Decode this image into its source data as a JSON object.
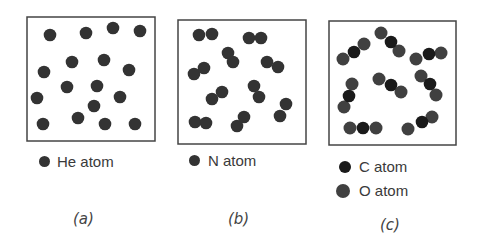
{
  "colors": {
    "he_atom": "#333333",
    "n_atom": "#333333",
    "c_atom": "#1a1a1a",
    "o_atom": "#404040",
    "box_border": "#444444",
    "text": "#3a3a3a"
  },
  "panels": [
    {
      "id": "a",
      "caption": "(a)",
      "legend": [
        {
          "label": "He atom",
          "atom": "he_atom"
        }
      ],
      "box": {
        "x": 27,
        "y": 17,
        "w": 128,
        "h": 124
      },
      "description": "Monatomic gas: helium atoms",
      "atoms": [
        [
          50,
          35
        ],
        [
          86,
          33
        ],
        [
          113,
          28
        ],
        [
          140,
          31
        ],
        [
          72,
          62
        ],
        [
          104,
          60
        ],
        [
          44,
          72
        ],
        [
          129,
          70
        ],
        [
          67,
          87
        ],
        [
          97,
          86
        ],
        [
          37,
          98
        ],
        [
          120,
          97
        ],
        [
          94,
          106
        ],
        [
          78,
          118
        ],
        [
          43,
          124
        ],
        [
          105,
          124
        ],
        [
          135,
          124
        ]
      ]
    },
    {
      "id": "b",
      "caption": "(b)",
      "legend": [
        {
          "label": "N atom",
          "atom": "n_atom"
        }
      ],
      "box": {
        "x": 178,
        "y": 20,
        "w": 128,
        "h": 124
      },
      "description": "Diatomic gas: N2 molecules",
      "molecules": [
        [
          [
            199,
            35
          ],
          [
            212,
            34
          ]
        ],
        [
          [
            249,
            38
          ],
          [
            261,
            38
          ]
        ],
        [
          [
            228,
            53
          ],
          [
            233,
            62
          ]
        ],
        [
          [
            267,
            62
          ],
          [
            278,
            67
          ]
        ],
        [
          [
            194,
            74
          ],
          [
            204,
            68
          ]
        ],
        [
          [
            212,
            99
          ],
          [
            222,
            92
          ]
        ],
        [
          [
            254,
            86
          ],
          [
            259,
            97
          ]
        ],
        [
          [
            286,
            104
          ],
          [
            280,
            116
          ]
        ],
        [
          [
            195,
            122
          ],
          [
            206,
            123
          ]
        ],
        [
          [
            237,
            126
          ],
          [
            244,
            117
          ]
        ]
      ]
    },
    {
      "id": "c",
      "caption": "(c)",
      "legend": [
        {
          "label": "C atom",
          "atom": "c_atom"
        },
        {
          "label": "O atom",
          "atom": "o_atom"
        }
      ],
      "box": {
        "x": 329,
        "y": 21,
        "w": 127,
        "h": 124
      },
      "description": "Triatomic gas: CO2 molecules (O-C-O)",
      "molecules": [
        [
          [
            343,
            59
          ],
          [
            354,
            52
          ],
          [
            364,
            44
          ]
        ],
        [
          [
            381,
            33
          ],
          [
            391,
            42
          ],
          [
            399,
            51
          ]
        ],
        [
          [
            416,
            59
          ],
          [
            429,
            54
          ],
          [
            441,
            53
          ]
        ],
        [
          [
            352,
            84
          ],
          [
            349,
            96
          ],
          [
            344,
            107
          ]
        ],
        [
          [
            379,
            79
          ],
          [
            391,
            85
          ],
          [
            401,
            92
          ]
        ],
        [
          [
            421,
            76
          ],
          [
            430,
            84
          ],
          [
            436,
            95
          ]
        ],
        [
          [
            350,
            128
          ],
          [
            363,
            128
          ],
          [
            376,
            128
          ]
        ],
        [
          [
            408,
            129
          ],
          [
            422,
            122
          ],
          [
            432,
            117
          ]
        ]
      ]
    }
  ]
}
